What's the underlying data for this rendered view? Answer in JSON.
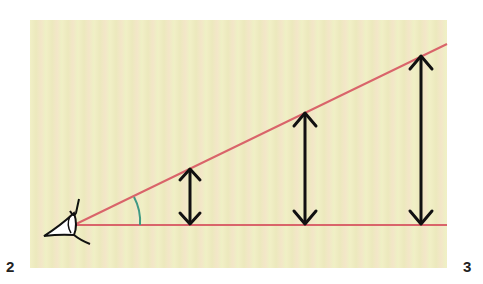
{
  "figure": {
    "labels": {
      "left": "2",
      "right": "3"
    },
    "colors": {
      "background": "#f0edc4",
      "rays": "#d9646a",
      "arrows": "#111111",
      "angle_arc": "#3f9a83"
    },
    "elements": {
      "eye": "eye-icon",
      "rays": [
        "upper-ray",
        "baseline-ray"
      ],
      "arrows": [
        "short",
        "medium",
        "tall"
      ],
      "angle": "viewing-angle-arc"
    }
  }
}
